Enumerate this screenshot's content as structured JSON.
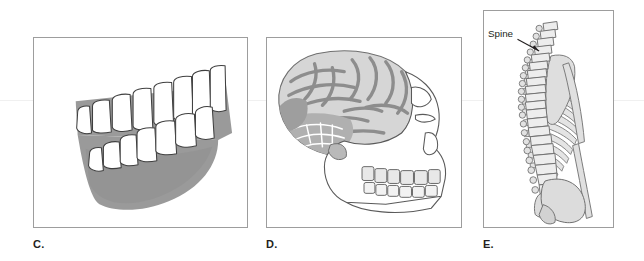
{
  "figure": {
    "background_color": "#ffffff",
    "frame_color": "#9d9d9d",
    "panels": [
      {
        "id": "panel-c",
        "label": "C.",
        "subject": "human-dentition-side-view",
        "description": "Side view of upper and lower tooth rows set in shaded gum and jaw tissue",
        "colors": {
          "tissue": "#9a9a9a",
          "tissue_shadow": "#8a8a8a",
          "tooth_fill": "#ffffff",
          "outline": "#3f3f3f"
        },
        "upper_teeth_count": 8,
        "lower_teeth_count": 7,
        "annotations": []
      },
      {
        "id": "panel-d",
        "label": "D.",
        "subject": "hominid-skull-with-brain-endocast",
        "description": "Lateral view of a hominid skull showing the brain endocast with gyri and sulci inside the cranium, plus upper and lower tooth rows in the jaw",
        "colors": {
          "brain_light": "#d6d6d6",
          "brain_mid": "#b4b4b4",
          "brain_dark": "#8d8d8d",
          "skull_fill": "#ffffff",
          "outline": "#5a5a5a"
        },
        "annotations": []
      },
      {
        "id": "panel-e",
        "label": "E.",
        "subject": "vertebral-column-with-ribcage-and-pelvis",
        "description": "Lateral view of the vertebral column with attached ribs, scapula, pelvis and femur",
        "colors": {
          "bone_fill": "#dcdcdc",
          "bone_light": "#ededed",
          "outline": "#6e6e6e",
          "leader_line": "#231f20"
        },
        "annotations": [
          {
            "id": "spine-callout",
            "text": "Spine",
            "target": "vertebral-column"
          }
        ]
      }
    ]
  }
}
